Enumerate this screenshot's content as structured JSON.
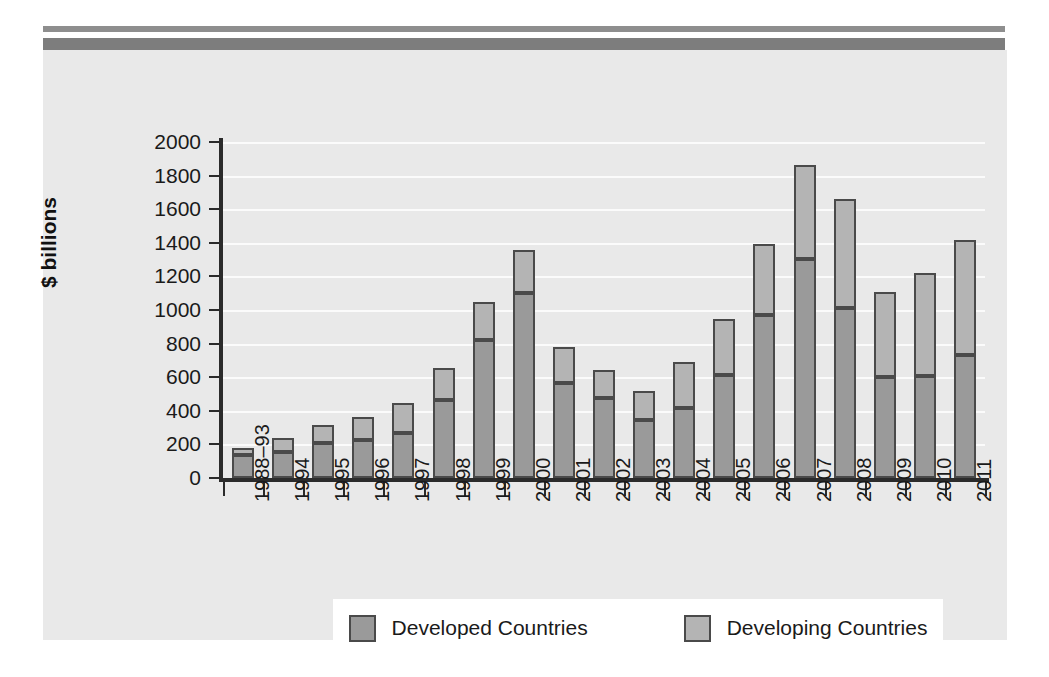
{
  "chart_data": {
    "type": "bar",
    "subtype": "stacked-vertical",
    "title": "",
    "xlabel": "",
    "ylabel": "$ billions",
    "ylim": [
      0,
      2000
    ],
    "yticks": [
      0,
      200,
      400,
      600,
      800,
      1000,
      1200,
      1400,
      1600,
      1800,
      2000
    ],
    "ytick_labels": [
      "0",
      "200",
      "400",
      "600",
      "800",
      "1000",
      "1200",
      "1400",
      "1600",
      "1800",
      "2000"
    ],
    "grid": true,
    "legend_position": "bottom",
    "categories": [
      "1988–93",
      "1994",
      "1995",
      "1996",
      "1997",
      "1998",
      "1999",
      "2000",
      "2001",
      "2002",
      "2003",
      "2004",
      "2005",
      "2006",
      "2007",
      "2008",
      "2009",
      "2010",
      "2011"
    ],
    "series": [
      {
        "name": "Developed Countries",
        "color": "#9a9a9a",
        "values": [
          135,
          155,
          210,
          225,
          265,
          465,
          820,
          1100,
          565,
          475,
          345,
          415,
          615,
          970,
          1305,
          1010,
          600,
          610,
          730
        ]
      },
      {
        "name": "Developing Countries",
        "color": "#b4b4b4",
        "values": [
          45,
          85,
          105,
          140,
          180,
          190,
          230,
          255,
          215,
          165,
          175,
          275,
          330,
          425,
          560,
          650,
          510,
          610,
          685
        ]
      }
    ],
    "totals": [
      180,
      240,
      315,
      365,
      445,
      655,
      1050,
      1355,
      780,
      640,
      520,
      690,
      945,
      1395,
      1865,
      1660,
      1110,
      1220,
      1415
    ]
  },
  "legend": {
    "items": [
      {
        "label": "Developed Countries",
        "color": "#9a9a9a"
      },
      {
        "label": "Developing Countries",
        "color": "#b4b4b4"
      }
    ]
  },
  "colors": {
    "panel_background": "#e9e9e9",
    "page_background": "#ffffff",
    "axis": "#2b2b2b",
    "gridline": "#fbfbfb",
    "bar_outline": "#4a4a4a",
    "rule_thin": "#8e8e8e",
    "rule_thick": "#7d7d7d",
    "legend_background": "#ffffff",
    "text": "#1a1a1a"
  }
}
